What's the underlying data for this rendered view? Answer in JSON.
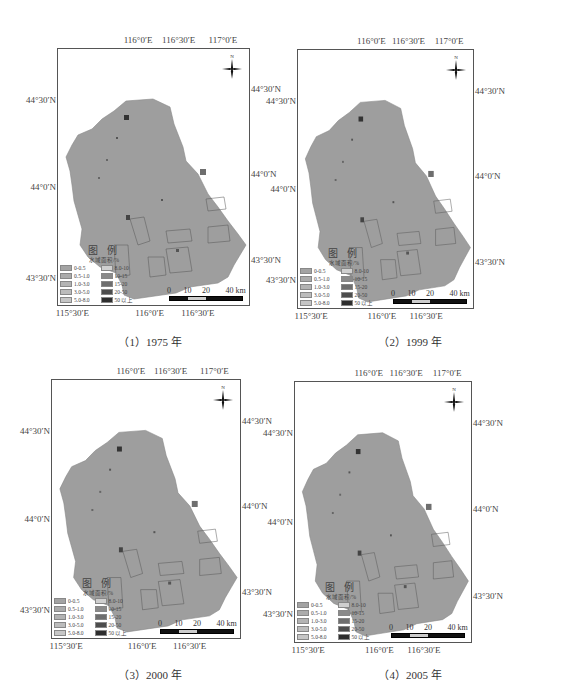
{
  "figure": {
    "panels": [
      {
        "id": "p1",
        "caption": "（1）1975 年",
        "frame": {
          "left": 57,
          "top": 48,
          "width": 193,
          "height": 258
        },
        "caption_x": 150,
        "caption_y": 333
      },
      {
        "id": "p2",
        "caption": "（2）1999 年",
        "frame": {
          "left": 297,
          "top": 49,
          "width": 177,
          "height": 260
        },
        "caption_x": 410,
        "caption_y": 333
      },
      {
        "id": "p3",
        "caption": "（3）2000 年",
        "frame": {
          "left": 51,
          "top": 379,
          "width": 190,
          "height": 260
        },
        "caption_x": 150,
        "caption_y": 666
      },
      {
        "id": "p4",
        "caption": "（4）2005 年",
        "frame": {
          "left": 294,
          "top": 381,
          "width": 178,
          "height": 262
        },
        "caption_x": 410,
        "caption_y": 666
      }
    ],
    "top_ticks": [
      "116°0′E",
      "116°30′E",
      "117°0′E"
    ],
    "bottom_ticks": [
      "115°30′E",
      "116°0′E",
      "116°30′E"
    ],
    "left_ticks": [
      "44°30′N",
      "44°0′N",
      "43°30′N"
    ],
    "right_ticks": [
      "44°30′N",
      "44°0′N",
      "43°30′N"
    ],
    "north_label": "N",
    "legend": {
      "title": "图  例",
      "subtitle": "水域面积/%",
      "classes": [
        {
          "label": "0-0.5",
          "color": "#a3a3a3"
        },
        {
          "label": "0.5-1.0",
          "color": "#ababab"
        },
        {
          "label": "1.0-3.0",
          "color": "#b3b3b3"
        },
        {
          "label": "3.0-5.0",
          "color": "#bcbcbc"
        },
        {
          "label": "5.0-8.0",
          "color": "#c6c6c6"
        },
        {
          "label": "8.0-10",
          "color": "#cfcfcf"
        },
        {
          "label": "10-15",
          "color": "#8a8a8a"
        },
        {
          "label": "15-20",
          "color": "#6e6e6e"
        },
        {
          "label": "20-50",
          "color": "#4d4d4d"
        },
        {
          "label": "50 以上",
          "color": "#2e2e2e"
        }
      ]
    },
    "scale_bar": {
      "labels": [
        "0",
        "10",
        "20",
        "40 km"
      ],
      "unit": "km"
    },
    "map_fill": "#9e9e9e",
    "map_outline": "#8a8a8a"
  }
}
